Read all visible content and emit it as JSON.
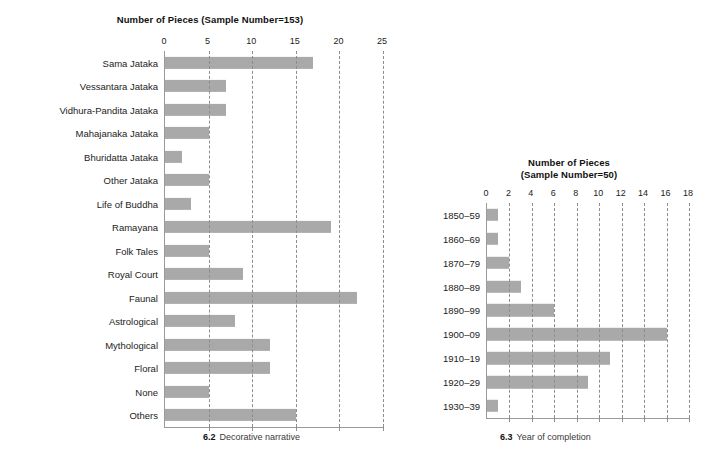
{
  "chart_data": [
    {
      "id": "decorative-narrative",
      "type": "bar",
      "orientation": "horizontal",
      "title": "Number of Pieces (Sample Number=153)",
      "sample_number": 153,
      "caption_number": "6.2",
      "caption_text": "Decorative narrative",
      "xlabel": "",
      "ylabel": "",
      "xlim": [
        0,
        25
      ],
      "xticks": [
        0,
        5,
        10,
        15,
        20,
        25
      ],
      "grid": true,
      "grid_style": "dashed-vertical",
      "bar_color": "#a9a9a9",
      "categories": [
        "Sama Jataka",
        "Vessantara Jataka",
        "Vidhura-Pandita Jataka",
        "Mahajanaka Jataka",
        "Bhuridatta Jataka",
        "Other Jataka",
        "Life of Buddha",
        "Ramayana",
        "Folk Tales",
        "Royal Court",
        "Faunal",
        "Astrological",
        "Mythological",
        "Floral",
        "None",
        "Others"
      ],
      "values": [
        17,
        7,
        7,
        5,
        2,
        5,
        3,
        19,
        5,
        9,
        22,
        8,
        12,
        12,
        5,
        15
      ]
    },
    {
      "id": "year-of-completion",
      "type": "bar",
      "orientation": "horizontal",
      "title": "Number of Pieces",
      "title_line2": "(Sample Number=50)",
      "sample_number": 50,
      "caption_number": "6.3",
      "caption_text": "Year of completion",
      "xlabel": "",
      "ylabel": "",
      "xlim": [
        0,
        18
      ],
      "xticks": [
        0,
        2,
        4,
        6,
        8,
        10,
        12,
        14,
        16,
        18
      ],
      "grid": true,
      "grid_style": "dashed-vertical",
      "bar_color": "#a9a9a9",
      "categories": [
        "1850–59",
        "1860–69",
        "1870–79",
        "1880–89",
        "1890–99",
        "1900–09",
        "1910–19",
        "1920–29",
        "1930–39"
      ],
      "values": [
        1,
        1,
        2,
        3,
        6,
        16,
        11,
        9,
        1
      ]
    }
  ]
}
